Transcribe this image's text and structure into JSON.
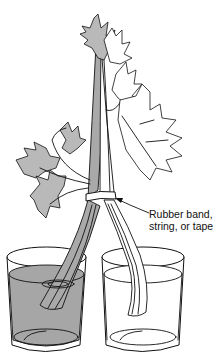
{
  "figure": {
    "callout_label": "Rubber band,\nstring, or tape",
    "left_glass": "dyed water",
    "right_glass": "clear water",
    "colors": {
      "ink": "#111111",
      "dyed_water": "#a6a6a6",
      "dyed_leaf": "#b9b9b9",
      "background": "#ffffff"
    }
  }
}
